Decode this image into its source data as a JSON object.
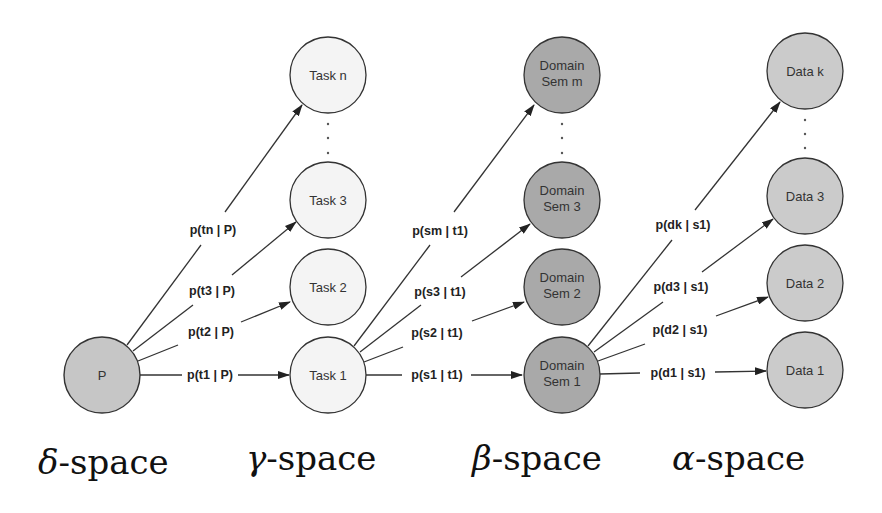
{
  "diagram": {
    "type": "probabilistic-hierarchy",
    "nodes": {
      "delta": [
        {
          "id": "P",
          "label": "P",
          "fill": "#c6c6c6"
        }
      ],
      "gamma": [
        {
          "id": "task1",
          "label": "Task 1",
          "fill": "#f4f4f4"
        },
        {
          "id": "task2",
          "label": "Task 2",
          "fill": "#f4f4f4"
        },
        {
          "id": "task3",
          "label": "Task 3",
          "fill": "#f4f4f4"
        },
        {
          "id": "taskn",
          "label": "Task n",
          "fill": "#f4f4f4"
        }
      ],
      "beta": [
        {
          "id": "sem1",
          "label_line1": "Domain",
          "label_line2": "Sem 1",
          "fill": "#a9a9a9"
        },
        {
          "id": "sem2",
          "label_line1": "Domain",
          "label_line2": "Sem 2",
          "fill": "#a9a9a9"
        },
        {
          "id": "sem3",
          "label_line1": "Domain",
          "label_line2": "Sem 3",
          "fill": "#a9a9a9"
        },
        {
          "id": "semm",
          "label_line1": "Domain",
          "label_line2": "Sem m",
          "fill": "#a9a9a9"
        }
      ],
      "alpha": [
        {
          "id": "data1",
          "label": "Data 1",
          "fill": "#cbcbcb"
        },
        {
          "id": "data2",
          "label": "Data 2",
          "fill": "#cbcbcb"
        },
        {
          "id": "data3",
          "label": "Data 3",
          "fill": "#cbcbcb"
        },
        {
          "id": "datak",
          "label": "Data k",
          "fill": "#cbcbcb"
        }
      ]
    },
    "edges": {
      "p_to_task": [
        {
          "from": "P",
          "to": "task1",
          "label": "p(t1 | P)"
        },
        {
          "from": "P",
          "to": "task2",
          "label": "p(t2 | P)"
        },
        {
          "from": "P",
          "to": "task3",
          "label": "p(t3 | P)"
        },
        {
          "from": "P",
          "to": "taskn",
          "label": "p(tn | P)"
        }
      ],
      "task_to_sem": [
        {
          "from": "task1",
          "to": "sem1",
          "label": "p(s1 | t1)"
        },
        {
          "from": "task1",
          "to": "sem2",
          "label": "p(s2 | t1)"
        },
        {
          "from": "task1",
          "to": "sem3",
          "label": "p(s3 | t1)"
        },
        {
          "from": "task1",
          "to": "semm",
          "label": "p(sm | t1)"
        }
      ],
      "sem_to_data": [
        {
          "from": "sem1",
          "to": "data1",
          "label": "p(d1 | s1)"
        },
        {
          "from": "sem1",
          "to": "data2",
          "label": "p(d2 | s1)"
        },
        {
          "from": "sem1",
          "to": "data3",
          "label": "p(d3 | s1)"
        },
        {
          "from": "sem1",
          "to": "datak",
          "label": "p(dk | s1)"
        }
      ]
    },
    "ellipsis": ".",
    "spaces": [
      {
        "symbol": "δ",
        "suffix": "-space"
      },
      {
        "symbol": "γ",
        "suffix": "-space"
      },
      {
        "symbol": "β",
        "suffix": "-space"
      },
      {
        "symbol": "α",
        "suffix": "-space"
      }
    ],
    "colors": {
      "stroke": "#333333",
      "arrow": "#222222"
    }
  }
}
